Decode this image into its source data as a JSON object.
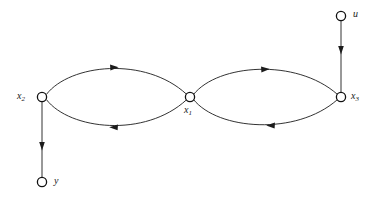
{
  "diagram": {
    "type": "directed-graph",
    "title": "",
    "background_color": "#ffffff",
    "stroke_color": "#1c1c1c",
    "node_fill_color": "#ffffff",
    "nodes": [
      {
        "id": "u",
        "label": "u",
        "sub": "",
        "x": 341,
        "y": 16,
        "label_x": 353,
        "label_y": 9,
        "radius": 4.6
      },
      {
        "id": "x2",
        "label": "x",
        "sub": "2",
        "x": 42,
        "y": 97,
        "label_x": 17,
        "label_y": 91,
        "radius": 4.6
      },
      {
        "id": "x1",
        "label": "x",
        "sub": "1",
        "x": 190,
        "y": 97,
        "label_x": 184,
        "label_y": 105,
        "radius": 4.6
      },
      {
        "id": "x3",
        "label": "x",
        "sub": "3",
        "x": 341,
        "y": 97,
        "label_x": 351,
        "label_y": 91,
        "radius": 4.6
      },
      {
        "id": "y",
        "label": "y",
        "sub": "",
        "x": 42,
        "y": 182,
        "label_x": 54,
        "label_y": 176,
        "radius": 4.6
      }
    ],
    "edges": [
      {
        "id": "x2-x1-upper",
        "from": "x2",
        "to": "x1",
        "shape": "curve-up",
        "direction": "forward",
        "arrow_at": "mid"
      },
      {
        "id": "x1-x2-lower",
        "from": "x1",
        "to": "x2",
        "shape": "curve-down",
        "direction": "backward",
        "arrow_at": "mid"
      },
      {
        "id": "x1-x3-upper",
        "from": "x1",
        "to": "x3",
        "shape": "curve-up",
        "direction": "forward",
        "arrow_at": "mid"
      },
      {
        "id": "x3-x1-lower",
        "from": "x3",
        "to": "x1",
        "shape": "curve-down",
        "direction": "backward",
        "arrow_at": "mid"
      },
      {
        "id": "u-x3",
        "from": "u",
        "to": "x3",
        "shape": "straight",
        "direction": "down",
        "arrow_at": "mid"
      },
      {
        "id": "x2-y",
        "from": "x2",
        "to": "y",
        "shape": "straight",
        "direction": "down",
        "arrow_at": "mid"
      }
    ]
  }
}
